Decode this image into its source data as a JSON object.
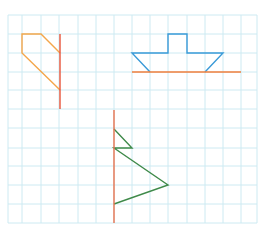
{
  "figure": {
    "grid": {
      "x_lines": [
        8,
        22,
        41,
        59,
        78,
        96,
        114,
        132,
        150,
        168,
        187,
        205,
        223,
        241,
        257
      ],
      "y_lines": [
        15,
        34,
        53,
        72,
        90,
        109,
        128,
        148,
        166,
        185,
        204,
        223
      ],
      "color": "#cdeaf2"
    },
    "shapes": [
      {
        "name": "orange-half-shape",
        "color": "#f4a64a",
        "points": "60,53 41,34 22,34 22,53 60,90"
      },
      {
        "name": "orange-mirror-line-1",
        "color": "#e8543a",
        "line": [
          60,
          34,
          60,
          109
        ]
      },
      {
        "name": "blue-boat-shape",
        "color": "#3a9ad8",
        "points": "150,72 132,53 168,53 168,34 187,34 187,53 223,53 205,72"
      },
      {
        "name": "orange-mirror-line-2",
        "color": "#f07f3c",
        "line": [
          132,
          72,
          241,
          72
        ]
      },
      {
        "name": "green-tree-shape",
        "color": "#3f8a4a",
        "points": "114,129 132,148 114,148 168,185 114,204"
      },
      {
        "name": "red-mirror-line-3",
        "color": "#e8734f",
        "line": [
          114,
          110,
          114,
          223
        ]
      }
    ]
  }
}
